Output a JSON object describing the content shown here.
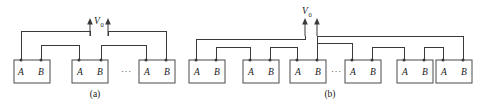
{
  "figure": {
    "background_color": "#ffffff",
    "line_color": "#3a3a3a",
    "box_stroke_color": "#4a4a4a",
    "box_fill_color": "#ffffff",
    "text_color": "#1a1a1a",
    "terminal_dot_color": "#3a3a3a",
    "panels": [
      {
        "id": "panel-a",
        "caption": "(a)",
        "voltage_label": "V",
        "voltage_subscript": "0",
        "ellipsis": "···",
        "cell_count_shown": 3,
        "connection_type": "series",
        "cells": [
          {
            "terminal_left": "A",
            "terminal_right": "B"
          },
          {
            "terminal_left": "A",
            "terminal_right": "B"
          },
          {
            "terminal_left": "A",
            "terminal_right": "B"
          }
        ]
      },
      {
        "id": "panel-b",
        "caption": "(b)",
        "voltage_label": "V",
        "voltage_subscript": "0",
        "ellipsis": "···",
        "cell_count_shown": 6,
        "connection_type": "series-parallel",
        "cells": [
          {
            "terminal_left": "A",
            "terminal_right": "B"
          },
          {
            "terminal_left": "A",
            "terminal_right": "B"
          },
          {
            "terminal_left": "A",
            "terminal_right": "B"
          },
          {
            "terminal_left": "A",
            "terminal_right": "B"
          },
          {
            "terminal_left": "A",
            "terminal_right": "B"
          },
          {
            "terminal_left": "A",
            "terminal_right": "B"
          }
        ]
      }
    ]
  }
}
